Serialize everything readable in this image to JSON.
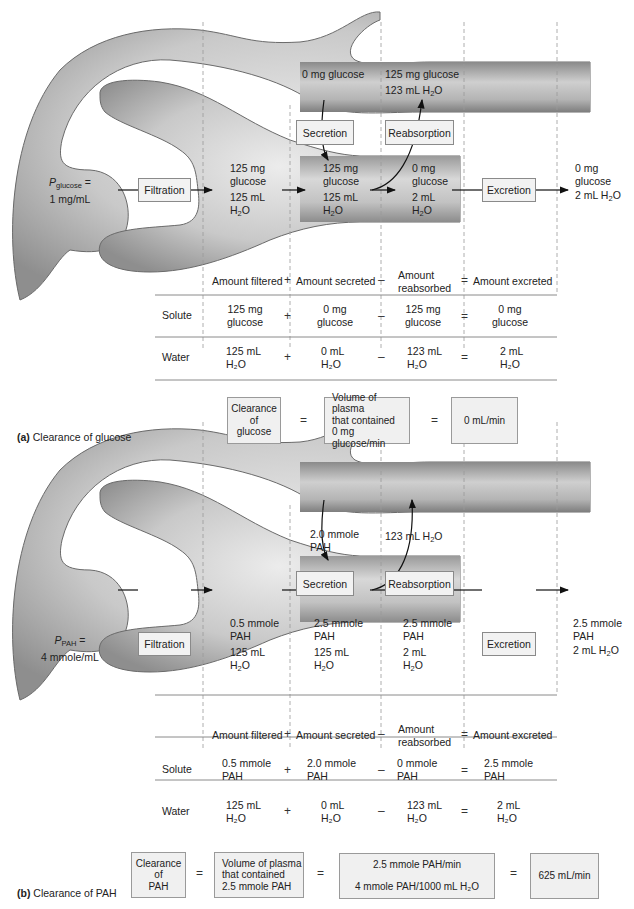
{
  "panel_a": {
    "caption_letter": "(a)",
    "caption_text": "Clearance of glucose",
    "plasma_label_p": "P",
    "plasma_label_sub": "glucose",
    "plasma_label_eq": " =",
    "plasma_conc": "1 mg/mL",
    "process_labels": {
      "filtration": "Filtration",
      "secretion": "Secretion",
      "reabsorption": "Reabsorption",
      "excretion": "Excretion"
    },
    "peritubular": {
      "secreted_from": "0 mg glucose",
      "reabsorbed_solute": "125 mg glucose",
      "reabsorbed_water": "123 mL H",
      "reabsorbed_water_tail": "O"
    },
    "tubule": {
      "filtered": {
        "solute1": "125 mg",
        "solute2": "glucose",
        "water1": "125 mL",
        "water2": "H",
        "water2_tail": "O"
      },
      "after_secretion": {
        "solute1": "125 mg",
        "solute2": "glucose",
        "water1": "125 mL",
        "water2": "H",
        "water2_tail": "O"
      },
      "after_reabsorption": {
        "solute1": "0 mg",
        "solute2": "glucose",
        "water1": "2 mL",
        "water2": "H",
        "water2_tail": "O"
      },
      "excreted": {
        "solute1": "0 mg",
        "solute2": "glucose",
        "water1": "2 mL H",
        "water1_tail": "O"
      }
    },
    "table": {
      "headers": [
        "Amount filtered",
        "Amount secreted",
        "Amount",
        "reabsorbed",
        "Amount excreted"
      ],
      "operators": [
        "+",
        "–",
        "="
      ],
      "rows": [
        {
          "label": "Solute",
          "cells": [
            [
              "125 mg",
              "glucose"
            ],
            [
              "0 mg",
              "glucose"
            ],
            [
              "125 mg",
              "glucose"
            ],
            [
              "0 mg",
              "glucose"
            ]
          ]
        },
        {
          "label": "Water",
          "cells": [
            [
              "125 mL",
              "H₂O"
            ],
            [
              "0 mL",
              "H₂O"
            ],
            [
              "123 mL",
              "H₂O"
            ],
            [
              "2 mL",
              "H₂O"
            ]
          ]
        }
      ]
    },
    "formula": {
      "box1": [
        "Clearance",
        "of",
        "glucose"
      ],
      "eq1": "=",
      "box2": [
        "Volume of plasma",
        "that contained",
        "0 mg glucose/min"
      ],
      "eq2": "=",
      "result": "0 mL/min"
    }
  },
  "panel_b": {
    "caption_letter": "(b)",
    "caption_text": "Clearance of PAH",
    "plasma_label_p": "P",
    "plasma_label_sub": "PAH",
    "plasma_label_eq": " =",
    "plasma_conc": "4 mmole/mL",
    "process_labels": {
      "filtration": "Filtration",
      "secretion": "Secretion",
      "reabsorption": "Reabsorption",
      "excretion": "Excretion"
    },
    "peritubular": {
      "secreted_from1": "2.0 mmole",
      "secreted_from2": "PAH",
      "reabsorbed_water": "123 mL H",
      "reabsorbed_water_tail": "O"
    },
    "tubule": {
      "filtered": {
        "solute1": "0.5 mmole",
        "solute2": "PAH",
        "water1": "125 mL",
        "water2": "H",
        "water2_tail": "O"
      },
      "after_secretion": {
        "solute1": "2.5 mmole",
        "solute2": "PAH",
        "water1": "125 mL",
        "water2": "H",
        "water2_tail": "O"
      },
      "after_reabsorption": {
        "solute1": "2.5 mmole",
        "solute2": "PAH",
        "water1": "2 mL",
        "water2": "H",
        "water2_tail": "O"
      },
      "excreted": {
        "solute1": "2.5 mmole",
        "solute2": "PAH",
        "water1": "2 mL H",
        "water1_tail": "O"
      }
    },
    "table": {
      "headers": [
        "Amount filtered",
        "Amount secreted",
        "Amount",
        "reabsorbed",
        "Amount excreted"
      ],
      "operators": [
        "+",
        "–",
        "="
      ],
      "rows": [
        {
          "label": "Solute",
          "cells": [
            [
              "0.5 mmole",
              "PAH"
            ],
            [
              "2.0 mmole",
              "PAH"
            ],
            [
              "0 mmole",
              "PAH"
            ],
            [
              "2.5 mmole",
              "PAH"
            ]
          ]
        },
        {
          "label": "Water",
          "cells": [
            [
              "125 mL",
              "H₂O"
            ],
            [
              "0 mL",
              "H₂O"
            ],
            [
              "123 mL",
              "H₂O"
            ],
            [
              "2 mL",
              "H₂O"
            ]
          ]
        }
      ]
    },
    "formula": {
      "box1": [
        "Clearance",
        "of",
        "PAH"
      ],
      "eq1": "=",
      "box2": [
        "Volume of plasma",
        "that contained",
        "2.5 mmole PAH"
      ],
      "eq2": "=",
      "box3_num": "2.5 mmole PAH/min",
      "box3_den": "4 mmole PAH/1000 mL H₂O",
      "eq3": "=",
      "result": "625 mL/min"
    }
  }
}
